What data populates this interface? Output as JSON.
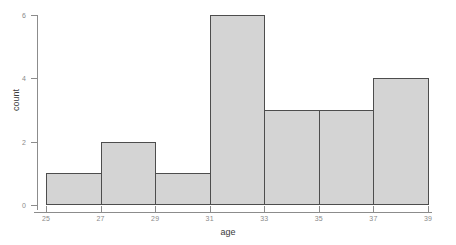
{
  "chart_data": {
    "type": "bar",
    "title": "",
    "subtitle": "",
    "xlabel": "age",
    "ylabel": "count",
    "bin_width": 2,
    "categories": [
      "25-27",
      "27-29",
      "29-31",
      "31-33",
      "33-35",
      "35-37",
      "37-39"
    ],
    "bin_edges": [
      25,
      27,
      29,
      31,
      33,
      35,
      37,
      39
    ],
    "values": [
      1,
      2,
      1,
      6,
      3,
      3,
      4
    ],
    "bars": [
      {
        "bin_start": 25,
        "bin_end": 27,
        "count": 1
      },
      {
        "bin_start": 27,
        "bin_end": 29,
        "count": 2
      },
      {
        "bin_start": 29,
        "bin_end": 31,
        "count": 1
      },
      {
        "bin_start": 31,
        "bin_end": 33,
        "count": 6
      },
      {
        "bin_start": 33,
        "bin_end": 35,
        "count": 3
      },
      {
        "bin_start": 35,
        "bin_end": 37,
        "count": 3
      },
      {
        "bin_start": 37,
        "bin_end": 39,
        "count": 4
      }
    ],
    "xlim": [
      25,
      39
    ],
    "ylim": [
      0,
      6
    ],
    "x_ticks": [
      25,
      27,
      29,
      31,
      33,
      35,
      37,
      39
    ],
    "y_ticks": [
      0,
      2,
      4,
      6
    ],
    "x_tick_labels": [
      "25",
      "27",
      "29",
      "31",
      "33",
      "35",
      "37",
      "39"
    ],
    "y_tick_labels": [
      "0",
      "2",
      "4",
      "6"
    ],
    "grid": false,
    "legend": false,
    "legend_position": "none",
    "colors": {
      "bar_fill": "#d4d4d4",
      "bar_border": "#4d4d4d",
      "axis_line": "#8c8c8c",
      "tick_label": "#8a8a8a",
      "axis_title": "#3a3a3a",
      "background": "#ffffff"
    }
  }
}
